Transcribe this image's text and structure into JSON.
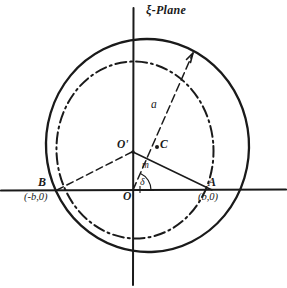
{
  "figure": {
    "title": "ξ-Plane",
    "domain": "complex-plane-diagram",
    "background_color": "#ffffff",
    "ink_color": "#1a1a1a"
  },
  "labels": {
    "point_B": "B",
    "point_B_coord": "(-b,0)",
    "point_A": "A",
    "point_A_coord": "(b,0)",
    "origin": "O",
    "center_prime": "O'",
    "point_C": "C",
    "radius_a": "a",
    "segment_m": "m",
    "angle_delta": "δ"
  },
  "geometry": {
    "axes": {
      "x_axis": {
        "x1": 0,
        "y1": 190,
        "x2": 287,
        "y2": 190
      },
      "y_axis": {
        "x1": 133,
        "y1": 8,
        "x2": 133,
        "y2": 284
      }
    },
    "outer_circle": {
      "style": "solid",
      "cx": 147,
      "cy": 145,
      "r": 104,
      "stroke_width": 2.1
    },
    "inner_circle": {
      "style": "dash-dot",
      "cx": 135,
      "cy": 150,
      "r": 89,
      "stroke_width": 1.9
    },
    "radius_line_B": {
      "x1": 57,
      "y1": 190,
      "x2": 133,
      "y2": 152,
      "style": "dashed"
    },
    "radius_line_A": {
      "x1": 133,
      "y1": 152,
      "x2": 212,
      "y2": 190,
      "style": "dashed"
    },
    "arrow_a": {
      "x1": 133,
      "y1": 190,
      "x2": 196,
      "y2": 47,
      "style": "dashed",
      "arrowhead": true
    },
    "point_C_dot": {
      "cx": 157,
      "cy": 147,
      "r": 1.8
    },
    "point_Oprime_dot": {
      "cx": 133,
      "cy": 152,
      "r": 1.6
    },
    "angle_arc_delta": {
      "cx": 133,
      "cy": 190,
      "r": 17,
      "start_deg": 0,
      "end_deg": 66
    }
  }
}
